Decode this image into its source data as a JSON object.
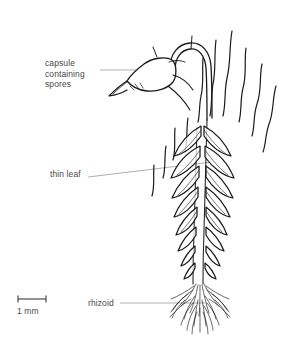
{
  "figure": {
    "background_color": "#ffffff",
    "ink_color": "#1a1a1a",
    "leader_color": "#8c8c8c",
    "text_color": "#4a4a4a"
  },
  "labels": {
    "capsule": "capsule\ncontaining\nspores",
    "capsule_line1": "capsule",
    "capsule_line2": "containing",
    "capsule_line3": "spores",
    "thin_leaf": "thin leaf",
    "rhizoid": "rhizoid"
  },
  "scale_bar": {
    "text": "1 mm",
    "length_px": 28,
    "value": 1,
    "unit": "mm"
  },
  "parts": [
    {
      "name": "capsule",
      "label": "capsule containing spores"
    },
    {
      "name": "seta",
      "label": ""
    },
    {
      "name": "thin-leaf",
      "label": "thin leaf"
    },
    {
      "name": "stem",
      "label": ""
    },
    {
      "name": "rhizoid",
      "label": "rhizoid"
    }
  ]
}
